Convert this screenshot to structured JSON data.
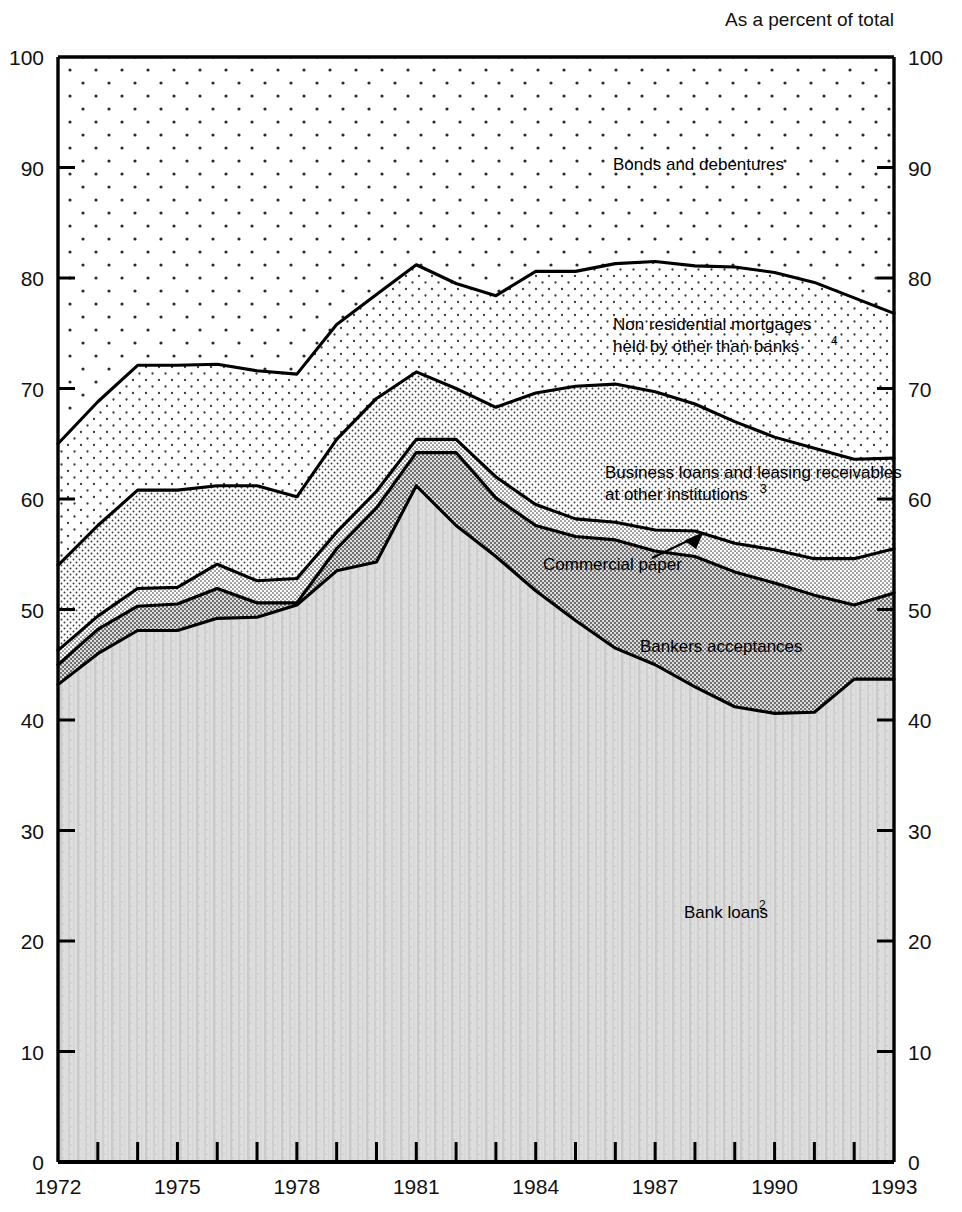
{
  "header": {
    "unit_note": "As a percent of total"
  },
  "axes": {
    "y_left_ticks": [
      "0",
      "10",
      "20",
      "30",
      "40",
      "50",
      "60",
      "70",
      "80",
      "90",
      "100"
    ],
    "y_right_ticks": [
      "0",
      "10",
      "20",
      "30",
      "40",
      "50",
      "60",
      "70",
      "80",
      "90",
      "100"
    ],
    "y_min": 0,
    "y_max": 100,
    "x_min": 1972,
    "x_max": 1993,
    "x_labels": [
      "1972",
      "1975",
      "1978",
      "1981",
      "1984",
      "1987",
      "1990",
      "1993"
    ],
    "x_label_years": [
      1972,
      1975,
      1978,
      1981,
      1984,
      1987,
      1990,
      1993
    ],
    "x_tick_years": [
      1972,
      1973,
      1974,
      1975,
      1976,
      1977,
      1978,
      1979,
      1980,
      1981,
      1982,
      1983,
      1984,
      1985,
      1986,
      1987,
      1988,
      1989,
      1990,
      1991,
      1992,
      1993
    ]
  },
  "series_labels": {
    "bonds": "Bonds and debentures",
    "mortgages_line1": "Non residential mortgages",
    "mortgages_line2": "held by other than banks",
    "mortgages_sup": "4",
    "business_loans_line1": "Business loans and leasing receivables",
    "business_loans_line2": "at other institutions",
    "business_loans_sup": "3",
    "commercial_paper": "Commercial paper",
    "bankers_acceptances": "Bankers acceptances",
    "bank_loans": "Bank loans",
    "bank_loans_sup": "2"
  },
  "chart_data": {
    "type": "area",
    "title": "",
    "subtitle": "",
    "xlabel": "",
    "ylabel": "As a percent of total",
    "ylim": [
      0,
      100
    ],
    "xlim": [
      1972,
      1993
    ],
    "grid": false,
    "legend": "inline-annotations",
    "stacking": "cumulative-boundaries",
    "note": "Values are cumulative upper boundaries of each stacked band, read from the axis. Bonds and debentures fill the remainder up to 100.",
    "x": [
      1972,
      1973,
      1974,
      1975,
      1976,
      1977,
      1978,
      1979,
      1980,
      1981,
      1982,
      1983,
      1984,
      1985,
      1986,
      1987,
      1988,
      1989,
      1990,
      1991,
      1992,
      1993
    ],
    "series": [
      {
        "name": "Bank loans",
        "order": 1,
        "fill": "vertical-streak-light-gray",
        "cumulative_top": [
          43.2,
          46.0,
          48.1,
          48.1,
          49.2,
          49.3,
          50.4,
          53.5,
          54.3,
          61.2,
          57.6,
          54.8,
          51.7,
          49.0,
          46.5,
          45.0,
          43.0,
          41.2,
          40.6,
          40.7,
          43.7,
          43.7
        ]
      },
      {
        "name": "Bankers acceptances",
        "order": 2,
        "fill": "medium-gray-stipple",
        "cumulative_top": [
          45.0,
          48.2,
          50.3,
          50.5,
          51.9,
          50.6,
          50.6,
          55.5,
          59.2,
          64.2,
          64.2,
          60.1,
          57.6,
          56.6,
          56.3,
          55.3,
          54.8,
          53.4,
          52.4,
          51.3,
          50.4,
          51.5
        ]
      },
      {
        "name": "Commercial paper",
        "order": 3,
        "fill": "fine-dot-gray",
        "cumulative_top": [
          46.3,
          49.4,
          51.9,
          52.0,
          54.1,
          52.6,
          52.8,
          57.0,
          60.7,
          65.4,
          65.4,
          62.0,
          59.5,
          58.2,
          57.9,
          57.2,
          57.1,
          56.0,
          55.4,
          54.6,
          54.6,
          55.5
        ]
      },
      {
        "name": "Business loans and leasing receivables at other institutions",
        "order": 4,
        "fill": "dot-screen-medium",
        "cumulative_top": [
          54.0,
          57.6,
          60.8,
          60.8,
          61.2,
          61.2,
          60.2,
          65.4,
          69.1,
          71.5,
          70.0,
          68.3,
          69.6,
          70.2,
          70.4,
          69.7,
          68.6,
          67.0,
          65.6,
          64.6,
          63.6,
          63.7
        ]
      },
      {
        "name": "Non residential mortgages held by other than banks",
        "order": 5,
        "fill": "light-dot-screen",
        "cumulative_top": [
          65.0,
          68.8,
          72.1,
          72.1,
          72.2,
          71.6,
          71.3,
          75.8,
          78.5,
          81.2,
          79.5,
          78.4,
          80.6,
          80.6,
          81.3,
          81.5,
          81.1,
          81.0,
          80.5,
          79.6,
          78.2,
          76.8
        ]
      },
      {
        "name": "Bonds and debentures",
        "order": 6,
        "fill": "sparse-dots",
        "cumulative_top": [
          100,
          100,
          100,
          100,
          100,
          100,
          100,
          100,
          100,
          100,
          100,
          100,
          100,
          100,
          100,
          100,
          100,
          100,
          100,
          100,
          100,
          100
        ]
      }
    ]
  }
}
